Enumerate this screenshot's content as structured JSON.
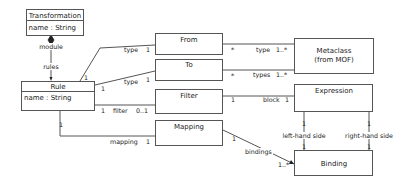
{
  "classes": {
    "transformation": {
      "name": "Transformation",
      "attribute": "name : String"
    },
    "rule": {
      "name": "Rule",
      "attribute": "name : String"
    },
    "from": {
      "name": "From"
    },
    "to": {
      "name": "To"
    },
    "filter": {
      "name": "Filter"
    },
    "mapping": {
      "name": "Mapping"
    },
    "metaclass": {
      "name_line1": "Metaclass",
      "name_line2": "(from MOF)"
    },
    "expression": {
      "name": "Expression"
    },
    "binding": {
      "name": "Binding"
    }
  },
  "associations": {
    "transformation_rule": {
      "source_role": "module",
      "target_role": "rules"
    },
    "rule_from": {
      "source_mult": "1",
      "role": "type",
      "target_mult": "1"
    },
    "rule_to": {
      "source_mult": "1",
      "role": "type",
      "target_mult": "1"
    },
    "rule_filter": {
      "source_mult": "1",
      "role": "filter",
      "target_mult": "0..1"
    },
    "rule_mapping": {
      "source_mult": "1",
      "role": "mapping",
      "target_mult": "1"
    },
    "from_metaclass": {
      "source_mult": "*",
      "role": "type",
      "target_mult": "1..*"
    },
    "to_metaclass": {
      "source_mult": "*",
      "role": "types",
      "target_mult": "1..*"
    },
    "filter_expression": {
      "source_mult": "1",
      "role": "block",
      "target_mult": "1"
    },
    "mapping_binding": {
      "source_mult": "1",
      "role": "bindings",
      "target_mult": "1..*"
    },
    "expression_binding_left": {
      "role": "left-hand side",
      "source_mult": "1",
      "target_mult": "1"
    },
    "expression_binding_right": {
      "role": "right-hand side",
      "source_mult": "1",
      "target_mult": "1"
    }
  }
}
